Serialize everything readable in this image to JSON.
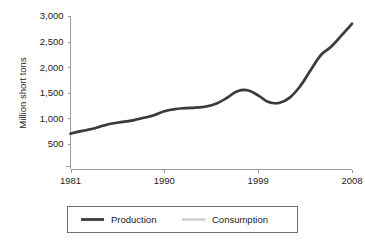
{
  "chart_data": {
    "type": "line",
    "title": "",
    "xlabel": "",
    "ylabel": "Million short tons",
    "xlim": [
      1981,
      2008
    ],
    "ylim": [
      0,
      3000
    ],
    "grid": false,
    "legend_position": "bottom",
    "x_tick_labels": [
      "1981",
      "1990",
      "1999",
      "2008"
    ],
    "x_ticks": [
      1981,
      1990,
      1999,
      2008
    ],
    "y_tick_labels": [
      "500",
      "1,000",
      "1,500",
      "2,000",
      "2,500",
      "3,000"
    ],
    "y_ticks": [
      500,
      1000,
      1500,
      2000,
      2500,
      3000
    ],
    "x": [
      1981,
      1982,
      1983,
      1984,
      1985,
      1986,
      1987,
      1988,
      1989,
      1990,
      1991,
      1992,
      1993,
      1994,
      1995,
      1996,
      1997,
      1998,
      1999,
      2000,
      2001,
      2002,
      2003,
      2004,
      2005,
      2006,
      2007,
      2008
    ],
    "series": [
      {
        "name": "Production",
        "color": "#3b3b3b",
        "values": [
          700,
          750,
          790,
          850,
          900,
          930,
          960,
          1010,
          1060,
          1140,
          1180,
          1200,
          1210,
          1230,
          1290,
          1400,
          1530,
          1550,
          1450,
          1320,
          1300,
          1400,
          1620,
          1930,
          2230,
          2400,
          2620,
          2850
        ]
      },
      {
        "name": "Consumption",
        "color": "#c9c9c9",
        "values": [
          690,
          740,
          785,
          845,
          895,
          925,
          955,
          1005,
          1055,
          1135,
          1175,
          1195,
          1205,
          1225,
          1285,
          1395,
          1520,
          1540,
          1440,
          1315,
          1300,
          1405,
          1630,
          1945,
          2245,
          2410,
          2630,
          2830
        ]
      }
    ],
    "legend": [
      {
        "label": "Production",
        "color": "#3b3b3b"
      },
      {
        "label": "Consumption",
        "color": "#cfcfcf"
      }
    ]
  }
}
